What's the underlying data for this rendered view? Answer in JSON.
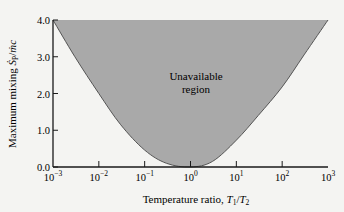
{
  "chart_data": {
    "type": "area",
    "title": "",
    "xlabel": "Temperature ratio, T1/T2",
    "xlabel_parts": {
      "prefix": "Temperature ratio, ",
      "var1": "T",
      "sub1": "1",
      "slash": "/",
      "var2": "T",
      "sub2": "2"
    },
    "ylabel": "Maximum mixing Ṡp/ṁc",
    "ylabel_parts": {
      "prefix": "Maximum mixing ",
      "var1": "Ṡ",
      "sub1": "P",
      "slash": "/",
      "var2": "ṁc"
    },
    "xscale": "log",
    "xlim": [
      0.001,
      1000
    ],
    "ylim": [
      0,
      4
    ],
    "x_ticks": [
      {
        "base": "10",
        "exp": "−3"
      },
      {
        "base": "10",
        "exp": "−2"
      },
      {
        "base": "10",
        "exp": "−1"
      },
      {
        "base": "10",
        "exp": "0"
      },
      {
        "base": "10",
        "exp": "1"
      },
      {
        "base": "10",
        "exp": "2"
      },
      {
        "base": "10",
        "exp": "3"
      }
    ],
    "y_ticks": [
      "0.0",
      "1.0",
      "2.0",
      "3.0",
      "4.0"
    ],
    "grid": false,
    "legend": null,
    "annotation": {
      "line1": "Unavailable",
      "line2": "region"
    },
    "series": [
      {
        "name": "Maximum mixing boundary",
        "x": [
          0.001,
          0.003,
          0.01,
          0.03,
          0.1,
          0.3,
          1,
          3,
          10,
          30,
          100,
          300,
          1000
        ],
        "values": [
          4.0,
          3.0,
          2.0,
          1.15,
          0.46,
          0.1,
          0.0,
          0.15,
          0.73,
          1.4,
          2.18,
          3.05,
          4.0
        ]
      }
    ],
    "fill_region": "above curve up to y=4.0 (unavailable region)",
    "colors": {
      "fill": "#a9a9a9",
      "curve": "#555555",
      "axis": "#1a1a1a",
      "background": "#f4f4f2"
    }
  }
}
